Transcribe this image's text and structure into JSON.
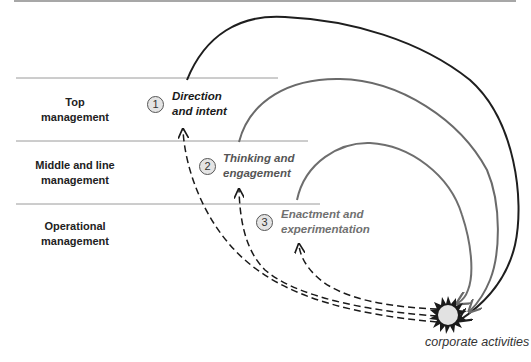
{
  "levels": [
    {
      "label_line1": "Top",
      "label_line2": "management"
    },
    {
      "label_line1": "Middle and line",
      "label_line2": "management"
    },
    {
      "label_line1": "Operational",
      "label_line2": "management"
    }
  ],
  "stages": [
    {
      "number": "1",
      "line1": "Direction",
      "line2": "and intent",
      "color": "#1a1a1a"
    },
    {
      "number": "2",
      "line1": "Thinking and",
      "line2": "engagement",
      "color": "#555555"
    },
    {
      "number": "3",
      "line1": "Enactment and",
      "line2": "experimentation",
      "color": "#707070"
    }
  ],
  "target": {
    "label": "corporate activities",
    "icon": "starburst-icon"
  },
  "colors": {
    "outer_arc": "#1e1e1e",
    "middle_arc": "#6a6a6a",
    "inner_arc": "#6e6e6e",
    "rules": "#9a9a9a",
    "dashed": "#1a1a1a",
    "burst_core": "#e2e2e2"
  }
}
